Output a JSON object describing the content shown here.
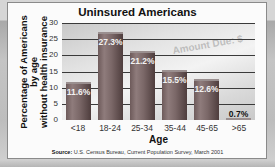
{
  "chart_data": {
    "type": "bar",
    "title": "Uninsured Americans",
    "xlabel": "Age",
    "ylabel": [
      "Percentage of Americans",
      "by age",
      "without health insurance"
    ],
    "categories": [
      "<18",
      "18-24",
      "25-34",
      "35-44",
      "45-65",
      ">65"
    ],
    "values": [
      11.6,
      27.3,
      21.2,
      15.5,
      12.6,
      0.7
    ],
    "value_labels": [
      "11.6%",
      "27.3%",
      "21.2%",
      "15.5%",
      "12.6%",
      "0.7%"
    ],
    "ylim": [
      0,
      30
    ],
    "yticks": [
      0,
      5,
      10,
      15,
      20,
      25,
      30
    ],
    "grid": true,
    "legend": null,
    "background_watermark": "Amount Due: $",
    "source_label": "Source:",
    "source_text": "U.S. Census Bureau, Current Population Survey, March 2001"
  },
  "colors": {
    "bar": "#7a6767",
    "gridline": "#3a3a3a",
    "panel": "#fbfbfb",
    "outer_background": "#b9b9b9"
  }
}
